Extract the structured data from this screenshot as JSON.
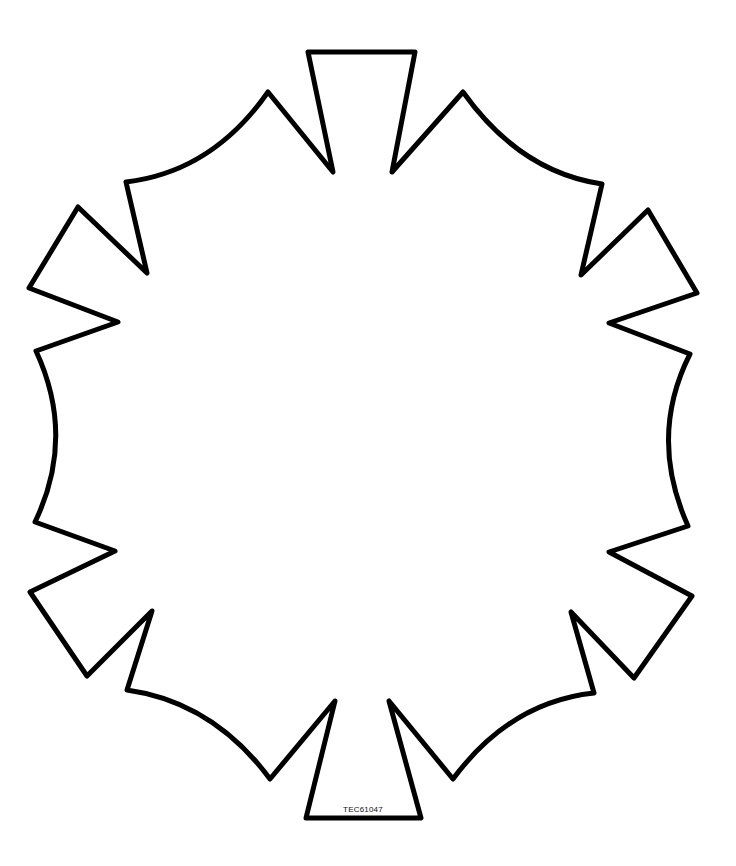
{
  "figure": {
    "code_label": "TEC61047",
    "stroke_color": "#000000",
    "background_color": "#ffffff"
  }
}
